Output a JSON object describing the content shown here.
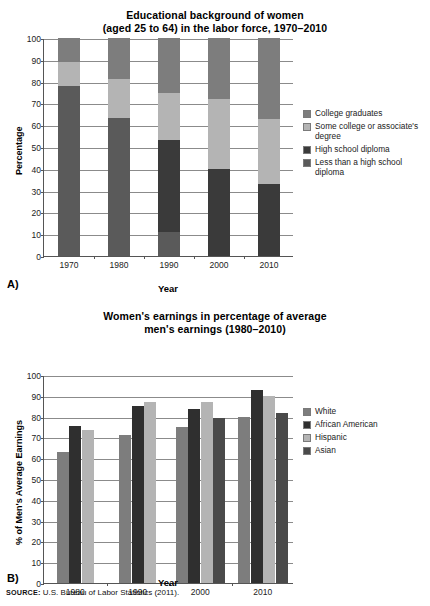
{
  "source": {
    "prefix": "SOURCE:",
    "text": "U.S. Bureau of Labor Statistics (2011)."
  },
  "panelA": {
    "label": "A)",
    "title_line1": "Educational background of women",
    "title_line2": "(aged 25 to 64) in the labor force, 1970–2010",
    "legend": [
      {
        "label": "College graduates",
        "color": "#7d7d7d"
      },
      {
        "label": "Some college or associate's degree",
        "color": "#b4b4b4"
      },
      {
        "label": "High school diploma",
        "color": "#3a3a3a"
      },
      {
        "label": "Less than a high school diploma",
        "color": "#5a5a5a"
      }
    ]
  },
  "panelB": {
    "label": "B)",
    "title_line1": "Women's earnings in percentage of average",
    "title_line2": "men's earnings (1980–2010)",
    "legend": [
      {
        "label": "White",
        "color": "#7d7d7d"
      },
      {
        "label": "African American",
        "color": "#2f2f2f"
      },
      {
        "label": "Hispanic",
        "color": "#b4b4b4"
      },
      {
        "label": "Asian",
        "color": "#4a4a4a"
      }
    ]
  },
  "chart_data": [
    {
      "type": "bar",
      "stacked": true,
      "title": "Educational background of women (aged 25 to 64) in the labor force, 1970–2010",
      "xlabel": "Year",
      "ylabel": "Percentage",
      "categories": [
        "1970",
        "1980",
        "1990",
        "2000",
        "2010"
      ],
      "yticks": [
        0,
        10,
        20,
        30,
        40,
        50,
        60,
        70,
        80,
        90,
        100
      ],
      "ylim": [
        0,
        100
      ],
      "grid": true,
      "legend_position": "right",
      "series": [
        {
          "name": "Less than a high school diploma",
          "color": "#5a5a5a",
          "values": [
            78,
            63.5,
            11,
            0,
            0
          ]
        },
        {
          "name": "High school diploma",
          "color": "#3a3a3a",
          "values": [
            0,
            0,
            42,
            40,
            33
          ]
        },
        {
          "name": "Some college or associate's degree",
          "color": "#b4b4b4",
          "values": [
            11,
            17.5,
            22,
            32,
            30
          ]
        },
        {
          "name": "College graduates",
          "color": "#7d7d7d",
          "values": [
            11,
            19,
            25,
            28,
            37
          ]
        }
      ]
    },
    {
      "type": "bar",
      "stacked": false,
      "title": "Women's earnings in percentage of average men's earnings (1980–2010)",
      "xlabel": "Year",
      "ylabel": "% of Men's Average Earnings",
      "categories": [
        "1980",
        "1990",
        "2000",
        "2010"
      ],
      "yticks": [
        0,
        10,
        20,
        30,
        40,
        50,
        60,
        70,
        80,
        90,
        100
      ],
      "ylim": [
        0,
        100
      ],
      "grid": true,
      "legend_position": "right",
      "series": [
        {
          "name": "White",
          "color": "#7d7d7d",
          "values": [
            63,
            71,
            75,
            80
          ]
        },
        {
          "name": "African American",
          "color": "#2f2f2f",
          "values": [
            75.5,
            85,
            83.5,
            93
          ]
        },
        {
          "name": "Hispanic",
          "color": "#b4b4b4",
          "values": [
            73.5,
            87,
            87,
            90
          ]
        },
        {
          "name": "Asian",
          "color": "#4a4a4a",
          "values": [
            null,
            null,
            79.5,
            81.5
          ]
        }
      ]
    }
  ]
}
